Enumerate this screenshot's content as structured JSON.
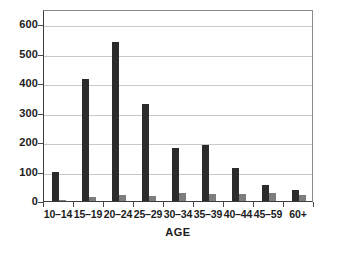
{
  "chart_data": {
    "type": "bar",
    "title": "",
    "xlabel": "AGE",
    "ylabel": "",
    "ylim": [
      0,
      600
    ],
    "yticks": [
      0,
      100,
      200,
      300,
      400,
      500,
      600
    ],
    "ytick_labels": [
      "0",
      "100",
      "200",
      "300",
      "400",
      "500",
      "600"
    ],
    "grid": true,
    "legend": "none",
    "categories": [
      "10–14",
      "15–19",
      "20–24",
      "25–29",
      "30–34",
      "35–39",
      "40–44",
      "45–59",
      "60+"
    ],
    "series": [
      {
        "name": "primary",
        "color": "#2b2b2b",
        "values": [
          100,
          414,
          540,
          329,
          180,
          191,
          113,
          55,
          38
        ]
      },
      {
        "name": "secondary",
        "color": "#7d7d7d",
        "values": [
          2,
          15,
          20,
          18,
          26,
          25,
          25,
          26,
          19
        ]
      }
    ]
  },
  "colors": {
    "background": "#ffffff",
    "axis": "#3d3d3d",
    "grid": "#c9c9c9",
    "bar_primary": "#2b2b2b",
    "bar_secondary": "#7d7d7d",
    "text": "#1c1c1c"
  }
}
